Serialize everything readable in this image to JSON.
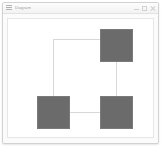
{
  "window": {
    "title": "Diagram",
    "icon": "menu-icon",
    "chrome_color": "#fbfbfb",
    "border_color": "#d2d2d2",
    "controls": [
      {
        "name": "minimize",
        "glyph": "minimize-icon"
      },
      {
        "name": "maximize",
        "glyph": "maximize-icon"
      },
      {
        "name": "close",
        "glyph": "close-icon"
      }
    ]
  },
  "canvas": {
    "background": "#ffffff",
    "border_color": "#e6e6e6",
    "width": 147,
    "height": 120
  },
  "diagram": {
    "node_color": "#6b6b6b",
    "node_border_color": "#7a7a7a",
    "edge_color": "#d8d8d8",
    "edge_width": 1,
    "node_size": 32,
    "nodes": [
      {
        "id": "node-top-right",
        "label": "",
        "x": 92,
        "y": 10
      },
      {
        "id": "node-bottom-left",
        "label": "",
        "x": 29,
        "y": 77
      },
      {
        "id": "node-bottom-right",
        "label": "",
        "x": 92,
        "y": 77
      }
    ],
    "edges": [
      {
        "id": "edge-topright-to-bottomleft",
        "from": "node-top-right",
        "to": "node-bottom-left",
        "shape": "elbow"
      },
      {
        "id": "edge-topright-to-bottomright",
        "from": "node-top-right",
        "to": "node-bottom-right",
        "shape": "vertical"
      },
      {
        "id": "edge-bottomleft-to-bottomright",
        "from": "node-bottom-left",
        "to": "node-bottom-right",
        "shape": "horizontal"
      }
    ]
  }
}
